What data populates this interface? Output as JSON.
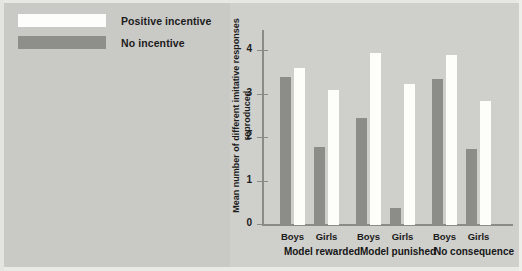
{
  "legend": {
    "items": [
      {
        "label": "Positive incentive",
        "swatch": "positive",
        "color": "#fdfdfb"
      },
      {
        "label": "No incentive",
        "swatch": "none",
        "color": "#8e8e8b"
      }
    ]
  },
  "axes": {
    "ylabel": "Mean number of different imitative responses reproduced",
    "yticks": [
      "0",
      "1",
      "2",
      "3",
      "4"
    ]
  },
  "chart_data": {
    "type": "bar",
    "title": "",
    "xlabel": "",
    "ylabel": "Mean number of different imitative responses reproduced",
    "ylim": [
      0,
      4
    ],
    "yticks": [
      0,
      1,
      2,
      3,
      4
    ],
    "grid": false,
    "legend_position": "top-left-outside",
    "groups": [
      "Model rewarded",
      "Model punished",
      "No consequence"
    ],
    "categories": [
      "Model rewarded – Boys",
      "Model rewarded – Girls",
      "Model punished – Boys",
      "Model punished – Girls",
      "No consequence – Boys",
      "No consequence – Girls"
    ],
    "subcategories": [
      "Boys",
      "Girls",
      "Boys",
      "Girls",
      "Boys",
      "Girls"
    ],
    "series": [
      {
        "name": "No incentive",
        "color": "#8c8c89",
        "values": [
          3.4,
          1.8,
          2.45,
          0.4,
          3.35,
          1.75
        ]
      },
      {
        "name": "Positive incentive",
        "color": "#fdfdfa",
        "values": [
          3.6,
          3.1,
          3.95,
          3.25,
          3.9,
          2.85
        ]
      }
    ]
  }
}
